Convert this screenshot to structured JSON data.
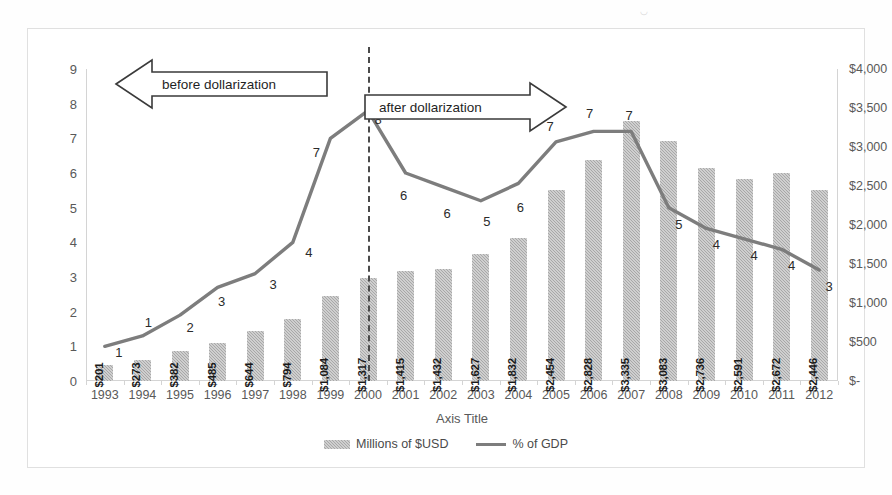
{
  "chart_data": {
    "type": "bar",
    "title": "",
    "xlabel": "Axis Title",
    "ylabel": "",
    "categories": [
      "1993",
      "1994",
      "1995",
      "1996",
      "1997",
      "1998",
      "1999",
      "2000",
      "2001",
      "2002",
      "2003",
      "2004",
      "2005",
      "2006",
      "2007",
      "2008",
      "2009",
      "2010",
      "2011",
      "2012"
    ],
    "grid": false,
    "legend_position": "bottom",
    "left_axis": {
      "label": "",
      "ticks": [
        "0",
        "1",
        "2",
        "3",
        "4",
        "5",
        "6",
        "7",
        "8",
        "9"
      ],
      "min": 0,
      "max": 9
    },
    "right_axis": {
      "label": "",
      "ticks": [
        "$-",
        "$500",
        "$1,000",
        "$1,500",
        "$2,000",
        "$2,500",
        "$3,000",
        "$3,500",
        "$4,000"
      ],
      "min": 0,
      "max": 4000
    },
    "series": [
      {
        "name": "Millions of $USD",
        "type": "bar",
        "axis": "right",
        "color": "#a8a8a8",
        "values": [
          201,
          273,
          382,
          485,
          644,
          794,
          1084,
          1317,
          1415,
          1432,
          1627,
          1832,
          2454,
          2828,
          3335,
          3083,
          2736,
          2591,
          2672,
          2446
        ],
        "labels": [
          "$201",
          "$273",
          "$382",
          "$485",
          "$644",
          "$794",
          "$1,084",
          "$1,317",
          "$1,415",
          "$1,432",
          "$1,627",
          "$1,832",
          "$2,454",
          "$2,828",
          "$3,335",
          "$3,083",
          "$2,736",
          "$2,591",
          "$2,672",
          "$2,446"
        ]
      },
      {
        "name": "% of GDP",
        "type": "line",
        "axis": "left",
        "color": "#7d7d7d",
        "values": [
          1.0,
          1.3,
          1.9,
          2.7,
          3.1,
          4.0,
          7.0,
          7.8,
          6.0,
          5.6,
          5.2,
          5.7,
          6.9,
          7.2,
          7.2,
          5.0,
          4.4,
          4.1,
          3.8,
          3.2
        ],
        "labels": [
          "1",
          "1",
          "2",
          "3",
          "3",
          "4",
          "7",
          "8",
          "6",
          "6",
          "5",
          "6",
          "7",
          "7",
          "7",
          "5",
          "4",
          "4",
          "4",
          "3"
        ]
      }
    ],
    "annotations": [
      {
        "name": "before-dollarization",
        "text": "before dollarization",
        "direction": "left"
      },
      {
        "name": "after-dollarization",
        "text": "after dollarization",
        "direction": "right"
      },
      {
        "name": "dollarization-divider",
        "text": "",
        "at_category": "2000"
      }
    ]
  },
  "legend": {
    "items": [
      {
        "label": "Millions of $USD",
        "marker": "bar-swatch"
      },
      {
        "label": "% of GDP",
        "marker": "line-swatch"
      }
    ]
  }
}
